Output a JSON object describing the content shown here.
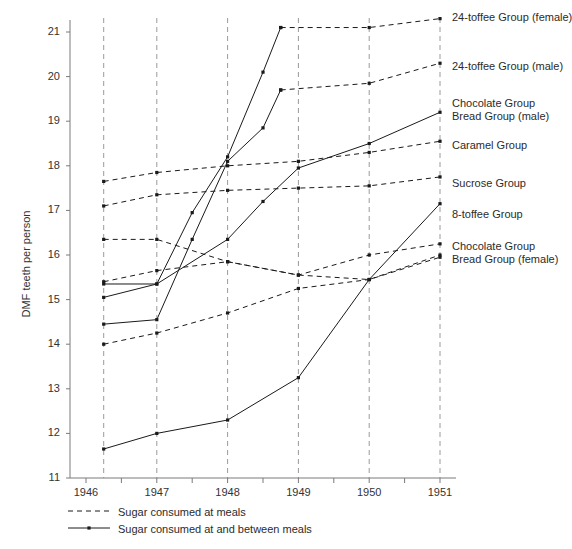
{
  "chart_data": {
    "type": "line",
    "title": "",
    "xlabel": "",
    "ylabel": "DMF teeth per person",
    "xlim": [
      1946,
      1951
    ],
    "ylim": [
      11,
      21.5
    ],
    "ytick_labels": [
      "21",
      "20",
      "19",
      "18",
      "17",
      "16",
      "15",
      "14",
      "13",
      "12",
      "11"
    ],
    "ytick_values": [
      21,
      20,
      19,
      18,
      17,
      16,
      15,
      14,
      13,
      12,
      11
    ],
    "xtick_labels": [
      "1946",
      "1947",
      "1948",
      "1949",
      "1950",
      "1951"
    ],
    "xtick_values": [
      1946,
      1947,
      1948,
      1949,
      1950,
      1951
    ],
    "grid": "vertical-dashed-at-data-years",
    "grid_x_values": [
      1946.25,
      1947,
      1948,
      1949,
      1950,
      1951
    ],
    "legend_position": "below-axis-left",
    "legend": [
      {
        "key": "dashed",
        "label": "Sugar consumed at meals"
      },
      {
        "key": "solid",
        "label": "Sugar consumed at and between meals"
      }
    ],
    "series": [
      {
        "name": "24-toffee Group (female)",
        "style": "solid",
        "label_y": 17,
        "x": [
          1946.25,
          1947,
          1947.5,
          1948,
          1948.5,
          1948.75
        ],
        "values": [
          15.05,
          15.35,
          16.95,
          18.2,
          20.1,
          21.1
        ]
      },
      {
        "name": "24-toffee Group (female) continued",
        "style": "dashed",
        "label_y": null,
        "x": [
          1948.75,
          1950,
          1951
        ],
        "values": [
          21.1,
          21.1,
          21.3
        ]
      },
      {
        "name": "24-toffee Group (male)",
        "style": "solid",
        "label_y": 66,
        "x": [
          1946.25,
          1947,
          1947.5,
          1948,
          1948.5,
          1948.75
        ],
        "values": [
          14.45,
          14.55,
          16.35,
          18.1,
          18.85,
          19.7
        ]
      },
      {
        "name": "24-toffee Group (male) continued",
        "style": "dashed",
        "label_y": null,
        "x": [
          1948.75,
          1950,
          1951
        ],
        "values": [
          19.7,
          19.85,
          20.3
        ]
      },
      {
        "name": "Chocolate Group\nBread Group (male)",
        "style": "solid",
        "label_y": 103,
        "x": [
          1946.25,
          1947,
          1948,
          1948.5,
          1949,
          1950,
          1951
        ],
        "values": [
          15.35,
          15.35,
          16.35,
          17.2,
          17.95,
          18.5,
          19.2
        ]
      },
      {
        "name": "Caramel Group",
        "style": "dashed",
        "label_y": 142,
        "x": [
          1946.25,
          1947,
          1948,
          1949,
          1950,
          1951
        ],
        "values": [
          17.65,
          17.85,
          18.0,
          18.1,
          18.3,
          18.55
        ]
      },
      {
        "name": "Sucrose Group",
        "style": "dashed",
        "label_y": 180,
        "x": [
          1946.25,
          1947,
          1948,
          1949,
          1950,
          1951
        ],
        "values": [
          17.1,
          17.35,
          17.45,
          17.5,
          17.55,
          17.75
        ]
      },
      {
        "name": "8-toffee Group",
        "style": "solid",
        "label_y": 211,
        "x": [
          1946.25,
          1947,
          1948,
          1949,
          1950,
          1951
        ],
        "values": [
          11.65,
          12.0,
          12.3,
          13.25,
          15.45,
          17.15
        ]
      },
      {
        "name": "Chocolate Group\nBread Group (female)",
        "style": "dashed",
        "label_y": 243,
        "x": [
          1946.25,
          1947,
          1948,
          1949,
          1950,
          1951
        ],
        "values": [
          16.35,
          16.35,
          15.85,
          15.55,
          16.0,
          16.25
        ]
      },
      {
        "name": "Chocolate Group Bread Group (female) b",
        "style": "dashed",
        "label_y": null,
        "x": [
          1946.25,
          1947,
          1948,
          1949,
          1950,
          1951
        ],
        "values": [
          15.4,
          15.65,
          15.85,
          15.55,
          15.45,
          16.0
        ]
      },
      {
        "name": "lower dashed trace",
        "style": "dashed",
        "label_y": null,
        "x": [
          1946.25,
          1947,
          1948,
          1949,
          1950,
          1951
        ],
        "values": [
          14.0,
          14.25,
          14.7,
          15.25,
          15.45,
          15.95
        ]
      }
    ]
  },
  "series_labels": [
    {
      "text": "24-toffee Group (female)",
      "line2": ""
    },
    {
      "text": "24-toffee Group (male)",
      "line2": ""
    },
    {
      "text": "Chocolate Group",
      "line2": "Bread Group (male)"
    },
    {
      "text": "Caramel Group",
      "line2": ""
    },
    {
      "text": "Sucrose Group",
      "line2": ""
    },
    {
      "text": "8-toffee Group",
      "line2": ""
    },
    {
      "text": "Chocolate Group",
      "line2": "Bread Group (female)"
    }
  ],
  "axis": {
    "y_title": "DMF teeth per person",
    "y_ticks": [
      "21",
      "20",
      "19",
      "18",
      "17",
      "16",
      "15",
      "14",
      "13",
      "12",
      "11"
    ],
    "x_ticks": [
      "1946",
      "1947",
      "1948",
      "1949",
      "1950",
      "1951"
    ]
  },
  "legend": {
    "row1": "Sugar consumed at meals",
    "row2": "Sugar consumed at and between meals"
  },
  "colors": {
    "ink": "#1a1a1a",
    "grid": "#9a9a9a",
    "axis": "#7a7a7a",
    "text": "#2b2b2b"
  }
}
